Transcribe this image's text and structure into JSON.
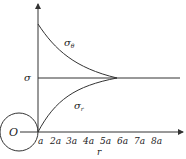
{
  "diagram": {
    "origin_label": "O",
    "sigma_label": "σ",
    "sigma_theta": {
      "base": "σ",
      "sub": "θ"
    },
    "sigma_r": {
      "base": "σ",
      "sub": "r"
    },
    "x_axis_label": "r",
    "x_ticks": [
      "a",
      "2a",
      "3a",
      "4a",
      "5a",
      "6a",
      "7a",
      "8a"
    ],
    "colors": {
      "line": "#333333",
      "text": "#222222",
      "background": "#ffffff"
    }
  }
}
